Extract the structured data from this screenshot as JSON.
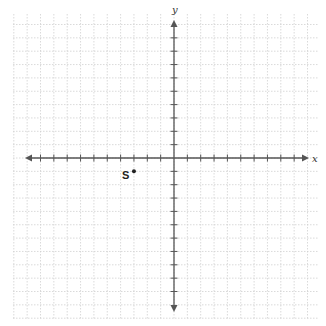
{
  "diagram": {
    "type": "coordinate-plane",
    "axes": {
      "x_label": "x",
      "y_label": "y",
      "x_range": [
        -11,
        10
      ],
      "y_range": [
        -11,
        10
      ],
      "tick_interval": 1,
      "arrows": true
    },
    "grid": {
      "visible": true,
      "style": "dotted",
      "interval": 1
    },
    "points": [
      {
        "label": "S",
        "x": -3,
        "y": -1
      }
    ],
    "colors": {
      "axis": "#555555",
      "grid": "#d0d0d0",
      "point": "#222222"
    }
  }
}
